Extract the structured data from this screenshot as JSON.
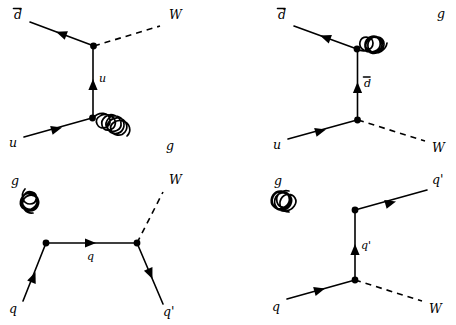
{
  "figure": {
    "background_color": "#ffffff",
    "line_color": "#000000",
    "width": 456,
    "height": 325
  },
  "diagrams": [
    {
      "id": "diagram-top-left",
      "position": "top-left",
      "description": "s-channel: d-bar u annihilation to W plus gluon, u quark exchange",
      "labels": {
        "in_upper": "d",
        "in_upper_bar": true,
        "in_lower": "u",
        "out_upper": "W",
        "out_lower": "g",
        "propagator": "u",
        "propagator_bar": false
      }
    },
    {
      "id": "diagram-top-right",
      "position": "top-right",
      "description": "d-bar u annihilation with gluon emitted from the anti-down line, d-bar exchange",
      "labels": {
        "in_upper": "d",
        "in_upper_bar": true,
        "in_lower": "u",
        "out_upper": "g",
        "out_lower": "W",
        "propagator": "d",
        "propagator_bar": true
      }
    },
    {
      "id": "diagram-bottom-left",
      "position": "bottom-left",
      "description": "gluon quark scattering producing W and q-prime, q quark exchange",
      "labels": {
        "in_upper": "g",
        "in_lower": "q",
        "out_upper": "W",
        "out_lower": "q'",
        "propagator": "q",
        "propagator_bar": false
      }
    },
    {
      "id": "diagram-bottom-right",
      "position": "bottom-right",
      "description": "gluon quark scattering producing q-prime and W, q-prime exchange",
      "labels": {
        "in_upper": "g",
        "in_lower": "q",
        "out_upper": "q'",
        "out_lower": "W",
        "propagator": "q'",
        "propagator_bar": false
      }
    }
  ],
  "label_texts": {
    "d_bar": "d",
    "u": "u",
    "g": "g",
    "W": "W",
    "q": "q",
    "q_prime": "q'",
    "overline": "̄"
  }
}
